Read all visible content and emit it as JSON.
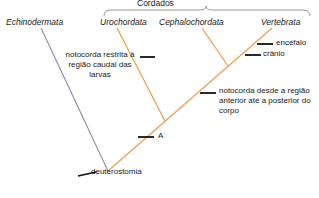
{
  "diagram": {
    "title_group": "Cordados",
    "taxa": [
      {
        "name": "Echinodermata",
        "x": 6,
        "y": 18
      },
      {
        "name": "Urochordata",
        "x": 100,
        "y": 18
      },
      {
        "name": "Cephalochordata",
        "x": 165,
        "y": 18
      },
      {
        "name": "Vertebrata",
        "x": 262,
        "y": 18
      }
    ],
    "annotations": [
      {
        "id": "notochord-larval",
        "text": "notocorda restrita à região caudal das larvas"
      },
      {
        "id": "notochord-full",
        "text": "notocorda desde a região anterior até a posterior do corpo"
      },
      {
        "id": "brain",
        "text": "encéfalo"
      },
      {
        "id": "skull",
        "text": "crânio"
      },
      {
        "id": "node-a",
        "text": "A"
      },
      {
        "id": "deuterostomia",
        "text": "deuterostomia"
      }
    ],
    "colors": {
      "echinoderm_branch": "#8b8bb0",
      "chordate_branch": "#eda055",
      "tick": "#111111",
      "bracket": "#8a8a8a",
      "text": "#1a1a1a"
    }
  }
}
